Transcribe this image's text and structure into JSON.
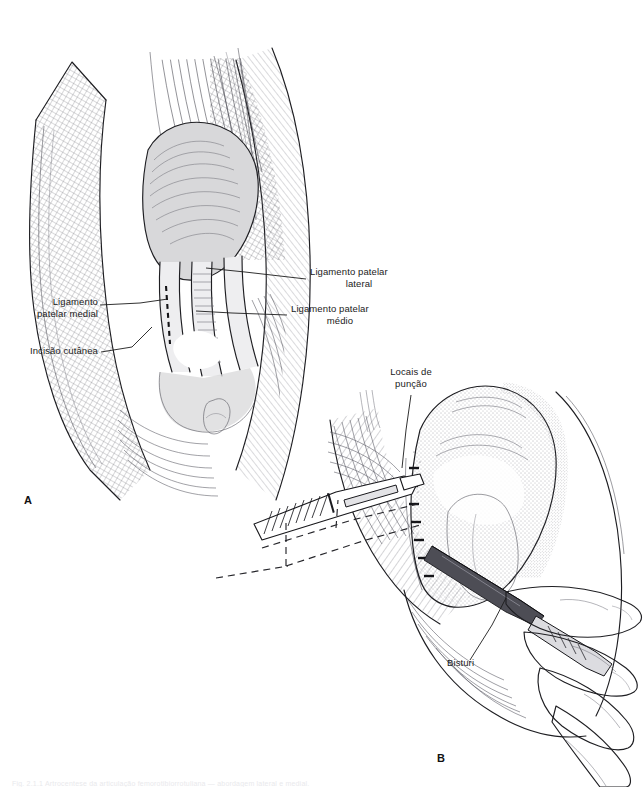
{
  "figure": {
    "background_color": "#ffffff",
    "ink_color": "#1e1e22",
    "shade_color": "#d8d8da",
    "panels": [
      {
        "id": "A",
        "letter": "A",
        "x": 24,
        "y": 494
      },
      {
        "id": "B",
        "letter": "B",
        "x": 437,
        "y": 752
      }
    ],
    "labels": [
      {
        "id": "ligamento-patelar-lateral",
        "lines": [
          "Ligamento patelar",
          "lateral"
        ],
        "align": "left",
        "x": 310,
        "y": 272,
        "leader": [
          [
            306,
            279
          ],
          [
            245,
            272
          ],
          [
            206,
            268
          ]
        ]
      },
      {
        "id": "ligamento-patelar-medio",
        "lines": [
          "Ligamento patelar",
          "médio"
        ],
        "align": "left",
        "x": 291,
        "y": 309,
        "leader": [
          [
            287,
            315
          ],
          [
            232,
            313
          ],
          [
            196,
            311
          ]
        ]
      },
      {
        "id": "ligamento-patelar-medial",
        "lines": [
          "Ligamento",
          "patelar medial"
        ],
        "align": "right",
        "x": 20,
        "y": 300,
        "leader": [
          [
            100,
            305
          ],
          [
            140,
            303
          ],
          [
            168,
            299
          ]
        ]
      },
      {
        "id": "incisao-cutanea",
        "lines": [
          "Incisão cutânea"
        ],
        "align": "right",
        "x": 17,
        "y": 347,
        "leader": [
          [
            101,
            352
          ],
          [
            132,
            347
          ],
          [
            152,
            327
          ]
        ]
      },
      {
        "id": "locais-de-puncao",
        "lines": [
          "Locais de",
          "punção"
        ],
        "align": "center",
        "x": 384,
        "y": 369,
        "leader": [
          [
            411,
            395
          ],
          [
            406,
            430
          ],
          [
            402,
            468
          ]
        ]
      },
      {
        "id": "bisturi",
        "lines": [
          "Bisturi"
        ],
        "align": "left",
        "x": 447,
        "y": 662,
        "leader": [
          [
            470,
            660
          ],
          [
            492,
            625
          ],
          [
            506,
            598
          ]
        ]
      }
    ],
    "caption": "Fig. 2.1.1  Artrocentese da articulação femorotibiorrotuliana — abordagem lateral e medial."
  }
}
